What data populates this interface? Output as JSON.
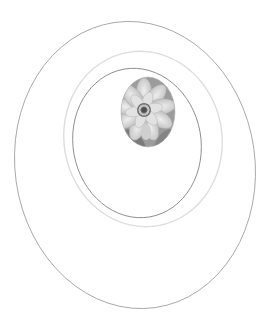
{
  "canvas": {
    "width": 272,
    "height": 329,
    "background": "#ffffff"
  },
  "rings": [
    {
      "name": "outer-ring",
      "cx": 135,
      "cy": 165,
      "rx": 120,
      "ry": 144,
      "rotate": -8,
      "stroke": "#9a9a9a",
      "width": 0.8
    },
    {
      "name": "middle-ring",
      "cx": 143,
      "cy": 139,
      "rx": 79,
      "ry": 88,
      "rotate": -10,
      "stroke": "#dedede",
      "width": 1.4
    },
    {
      "name": "inner-ring",
      "cx": 137,
      "cy": 143,
      "rx": 64,
      "ry": 75,
      "rotate": -10,
      "stroke": "#8a8a8a",
      "width": 0.9
    }
  ],
  "photo": {
    "subject": "water lily flower (grayscale)",
    "cx": 148,
    "cy": 112,
    "rx": 27,
    "ry": 35,
    "flower_cx": 144,
    "flower_cy": 110,
    "colors": {
      "bg": "#9c9c9c",
      "petal": "#d4d4d4",
      "petal_shade": "#b8b8b8",
      "center": "#6e6e6e",
      "leaf": "#7a7a7a"
    }
  }
}
